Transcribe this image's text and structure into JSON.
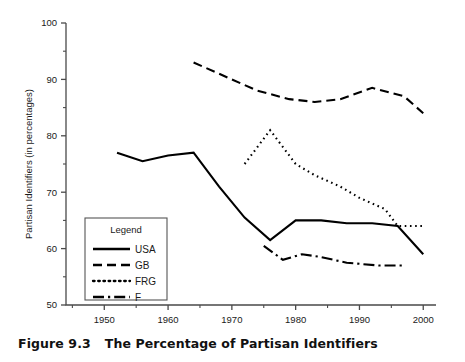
{
  "caption": {
    "number": "Figure 9.3",
    "title": "The Percentage of Partisan Identifiers"
  },
  "axes": {
    "ylabel": "Partisan Identifiers (in percentages)",
    "xlabel": "",
    "ytick_labels": [
      "50",
      "60",
      "70",
      "80",
      "90",
      "100"
    ],
    "xtick_labels": [
      "1950",
      "1960",
      "1970",
      "1980",
      "1990",
      "2000"
    ]
  },
  "legend": {
    "title": "Legend",
    "entries": [
      {
        "label": "USA",
        "dash": "none"
      },
      {
        "label": "GB",
        "dash": "dashed"
      },
      {
        "label": "FRG",
        "dash": "dotted"
      },
      {
        "label": "F",
        "dash": "dashdot"
      }
    ]
  },
  "chart_data": {
    "type": "line",
    "title": "The Percentage of Partisan Identifiers",
    "xlabel": "",
    "ylabel": "Partisan Identifiers (in percentages)",
    "xlim": [
      1944,
      2002
    ],
    "ylim": [
      50,
      100
    ],
    "yticks": [
      50,
      60,
      70,
      80,
      90,
      100
    ],
    "xticks": [
      1950,
      1960,
      1970,
      1980,
      1990,
      2000
    ],
    "minor_xticks": [
      1945,
      1955,
      1965,
      1975,
      1985,
      1995
    ],
    "minor_yticks": [
      55,
      65,
      75,
      85,
      95
    ],
    "grid": false,
    "legend_position": "lower-left-inset",
    "series": [
      {
        "name": "USA",
        "style": "solid",
        "x": [
          1952,
          1956,
          1960,
          1964,
          1968,
          1972,
          1976,
          1980,
          1984,
          1988,
          1992,
          1996,
          2000
        ],
        "values": [
          77,
          75.5,
          76.5,
          77,
          71,
          65.5,
          61.5,
          65,
          65,
          64.5,
          64.5,
          64,
          59
        ]
      },
      {
        "name": "GB",
        "style": "dashed",
        "x": [
          1964,
          1966,
          1970,
          1974,
          1979,
          1983,
          1987,
          1992,
          1997,
          2000
        ],
        "values": [
          93,
          92,
          90,
          88,
          86.5,
          86,
          86.5,
          88.5,
          87,
          84
        ]
      },
      {
        "name": "FRG",
        "style": "dotted",
        "x": [
          1972,
          1976,
          1980,
          1983,
          1987,
          1990,
          1994,
          1996,
          2000
        ],
        "values": [
          75,
          81,
          75,
          73,
          71,
          69,
          67,
          64,
          64
        ]
      },
      {
        "name": "F",
        "style": "dashdot",
        "x": [
          1975,
          1978,
          1981,
          1984,
          1988,
          1993,
          1997
        ],
        "values": [
          60.5,
          58,
          59,
          58.5,
          57.5,
          57,
          57
        ]
      }
    ]
  }
}
